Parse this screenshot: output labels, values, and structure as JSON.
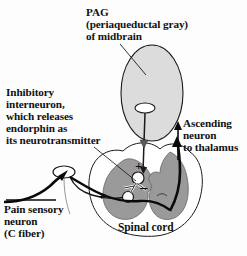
{
  "figure": {
    "background_color": "#fdfdfd"
  },
  "labels": {
    "pag": "PAG\n(periaqueductal gray)\nof midbrain",
    "inhibitory_interneuron": "Inhibitory\ninterneuron,\nwhich releases\nendorphin as\nits neurotransmitter",
    "ascending_neuron": "Ascending\nneuron\nto thalamus",
    "pain_sensory_neuron": "Pain sensory\nneuron\n(C fiber)",
    "spinal_cord": "Spinal cord"
  },
  "signs": {
    "descending_excitatory": "+",
    "sensory_excitatory": "+",
    "inhibitory": "–"
  },
  "colors": {
    "pag_fill": "#dcdcdc",
    "gray_matter_fill": "#9a9a9a",
    "white_matter_fill": "#ffffff",
    "outline": "#1a1a1a",
    "text": "#111111",
    "cell_body_fill": "#ffffff"
  },
  "structures": [
    {
      "name": "pag-ellipse",
      "label": "periaqueductal gray of midbrain",
      "fill": "#dcdcdc"
    },
    {
      "name": "pag-cell-body",
      "label": "PAG neuron cell body",
      "fill": "#ffffff"
    },
    {
      "name": "descending-axon",
      "label": "descending axon from PAG to spinal cord"
    },
    {
      "name": "spinal-cord-outline",
      "label": "spinal cord white matter outline",
      "fill": "#ffffff"
    },
    {
      "name": "gray-matter-left-horn",
      "label": "dorsal/ventral gray matter left",
      "fill": "#9a9a9a"
    },
    {
      "name": "gray-matter-right-horn",
      "label": "dorsal/ventral gray matter right",
      "fill": "#9a9a9a"
    },
    {
      "name": "interneuron-cell-body",
      "label": "inhibitory interneuron cell body",
      "fill": "#ffffff"
    },
    {
      "name": "interneuron-axon",
      "label": "inhibitory interneuron axon"
    },
    {
      "name": "pain-sensory-axon",
      "label": "pain sensory C fiber axon"
    },
    {
      "name": "pain-sensory-terminal",
      "label": "pain sensory neuron terminal"
    },
    {
      "name": "ascending-axon",
      "label": "ascending neuron axon to thalamus"
    },
    {
      "name": "leader-line-pag",
      "label": "leader line from PAG label"
    },
    {
      "name": "leader-line-interneuron",
      "label": "leader line from inhibitory interneuron label"
    },
    {
      "name": "leader-line-pain",
      "label": "leader line from pain sensory neuron label"
    },
    {
      "name": "leader-line-ascending",
      "label": "arrow from ascending neuron label"
    }
  ]
}
